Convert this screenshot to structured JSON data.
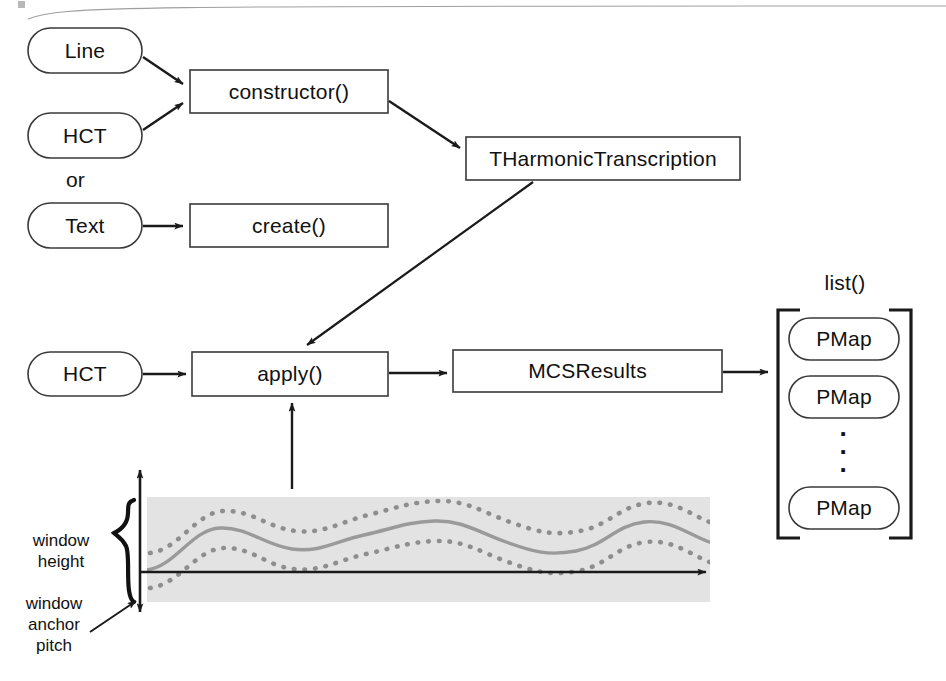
{
  "diagram": {
    "colors": {
      "stroke": "#1a1a1a",
      "box_border": "#3a3a3a",
      "window_fill": "#e3e3e3",
      "wave_solid": "#9a9a9a",
      "wave_dotted": "#8e8e8e",
      "text": "#111111"
    },
    "nodes": {
      "line_pill": "Line",
      "hct_pill_top": "HCT",
      "or_text": "or",
      "text_pill": "Text",
      "constructor_box": "constructor()",
      "create_box": "create()",
      "tharmonic_box": "THarmonicTranscription",
      "hct_pill_mid": "HCT",
      "apply_box": "apply()",
      "mcsresults_box": "MCSResults",
      "list_label": "list()",
      "pmap_1": "PMap",
      "pmap_2": "PMap",
      "pmap_n": "PMap",
      "ellipsis": "·"
    },
    "annotations": {
      "window_height": "window\nheight",
      "window_anchor_pitch": "window\nanchor\npitch"
    }
  }
}
